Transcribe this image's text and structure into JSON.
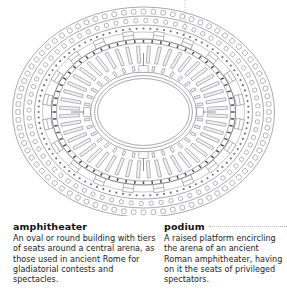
{
  "illustration": {
    "name": "amphitheater-floor-plan",
    "description": "Elliptical architectural floor plan of a Roman amphitheater showing concentric rings of arcades, radial walls, seating tiers and a central oval arena",
    "style": {
      "line_color": "#7a7a86",
      "dark_line_color": "#55555f",
      "fill_color": "#ffffff",
      "background": "#ffffff"
    },
    "rings": [
      {
        "id": "outer-arcade",
        "label": "outer arcade ring",
        "opening_count": 80
      },
      {
        "id": "second-arcade",
        "label": "second arcade ring",
        "opening_count": 72
      },
      {
        "id": "dotted-corridor",
        "label": "dotted corridor ring"
      },
      {
        "id": "seating-tier",
        "label": "radial seating wall tier",
        "wall_count": 48
      },
      {
        "id": "podium-wall",
        "label": "podium wall around arena"
      },
      {
        "id": "arena",
        "label": "central oval arena"
      }
    ],
    "callouts": [
      {
        "target": "podium",
        "type": "dotted-leader",
        "orientation": "vertical-top"
      }
    ]
  },
  "entries": [
    {
      "id": "amphitheater",
      "headword": "amphitheater",
      "has_leader": false,
      "lines": [
        "An oval or round building with tiers",
        "of seats around a central arena, as",
        "those used in ancient Rome for",
        "gladiatorial contests and",
        "spectacles."
      ]
    },
    {
      "id": "podium",
      "headword": "podium",
      "has_leader": true,
      "lines": [
        "A raised platform encircling",
        "the arena of an ancient",
        "Roman amphitheater, having",
        "on it the seats of privileged",
        "spectators."
      ]
    }
  ]
}
